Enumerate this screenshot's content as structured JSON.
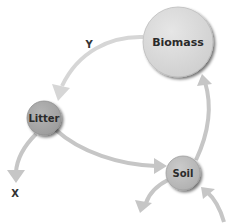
{
  "diagram": {
    "title": "",
    "nodes": [
      {
        "id": "biomass",
        "label": "Biomass",
        "color": "#d9d9d9",
        "cx": 178,
        "cy": 42,
        "r": 35,
        "font_size": 11
      },
      {
        "id": "litter",
        "label": "Litter",
        "color": "#a9a9a9",
        "cx": 44,
        "cy": 118,
        "r": 17,
        "font_size": 10
      },
      {
        "id": "soil",
        "label": "Soil",
        "color": "#bdbdbd",
        "cx": 183,
        "cy": 173,
        "r": 17,
        "font_size": 10
      }
    ],
    "edges": [
      {
        "from": "biomass",
        "to": "litter",
        "label": "Y"
      },
      {
        "from": "litter",
        "to": "soil",
        "label": ""
      },
      {
        "from": "soil",
        "to": "biomass",
        "label": ""
      },
      {
        "from": "litter",
        "to": "out",
        "label": "X"
      },
      {
        "from": "soil",
        "to": "out",
        "label": ""
      },
      {
        "from": "in",
        "to": "soil",
        "label": ""
      }
    ],
    "labels": {
      "y": "Y",
      "x": "X",
      "biomass": "Biomass",
      "litter": "Litter",
      "soil": "Soil"
    },
    "colors": {
      "arrow": "#c4c4c4",
      "arrow_light": "#d3d3d3",
      "shadow": "#8a8a8a"
    }
  }
}
